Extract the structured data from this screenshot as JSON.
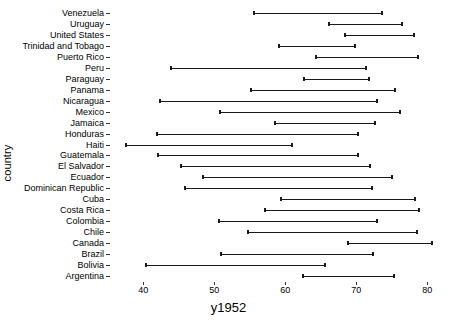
{
  "chart_data": {
    "type": "range",
    "title": "",
    "subtitle": "",
    "xlabel": "y1952",
    "ylabel": "country",
    "xlim": [
      36.0,
      83.5
    ],
    "xticks": [
      40,
      50,
      60,
      70,
      80
    ],
    "xtick_labels": [
      "40",
      "50",
      "60",
      "70",
      "80"
    ],
    "grid": false,
    "legend": null,
    "annotations": [],
    "categories": [
      "Venezuela",
      "Uruguay",
      "United States",
      "Trinidad and Tobago",
      "Puerto Rico",
      "Peru",
      "Paraguay",
      "Panama",
      "Nicaragua",
      "Mexico",
      "Jamaica",
      "Honduras",
      "Haiti",
      "Guatemala",
      "El Salvador",
      "Ecuador",
      "Dominican Republic",
      "Cuba",
      "Costa Rica",
      "Colombia",
      "Chile",
      "Canada",
      "Brazil",
      "Bolivia",
      "Argentina"
    ],
    "series": [
      {
        "name": "start",
        "values": [
          55.6,
          66.1,
          68.4,
          59.1,
          64.3,
          43.9,
          62.6,
          55.2,
          42.3,
          50.8,
          58.5,
          41.9,
          37.6,
          42.0,
          45.3,
          48.4,
          45.9,
          59.4,
          57.2,
          50.6,
          54.7,
          68.8,
          50.9,
          40.4,
          62.5
        ]
      },
      {
        "name": "end",
        "values": [
          73.7,
          76.4,
          78.2,
          69.8,
          78.7,
          71.4,
          71.8,
          75.5,
          72.9,
          76.2,
          72.6,
          70.2,
          60.9,
          70.3,
          71.9,
          75.0,
          72.2,
          78.3,
          78.8,
          72.9,
          78.6,
          80.7,
          72.4,
          65.6,
          75.3
        ]
      }
    ]
  },
  "axes": {
    "x_title": "y1952",
    "y_title": "country"
  },
  "style": {
    "line_color": "#1a1a1a",
    "text_color": "#000000",
    "tick_color": "#333333",
    "background": "#ffffff"
  }
}
